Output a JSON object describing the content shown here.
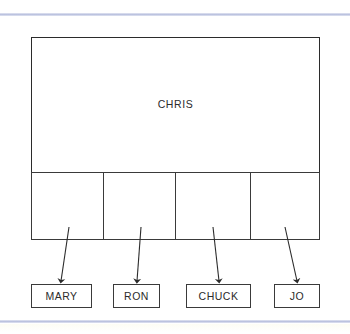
{
  "figure": {
    "kind": "hierarchy-diagram",
    "background_color": "#ffffff",
    "stroke_color": "#2b2b2b",
    "rule_color": "#b9c0de"
  },
  "parent": {
    "label": "CHRIS"
  },
  "cells": [
    {
      "index": 0,
      "label": ""
    },
    {
      "index": 1,
      "label": ""
    },
    {
      "index": 2,
      "label": ""
    },
    {
      "index": 3,
      "label": ""
    }
  ],
  "leaves": [
    {
      "label": "MARY"
    },
    {
      "label": "RON"
    },
    {
      "label": "CHUCK"
    },
    {
      "label": "JO"
    }
  ],
  "connectors": [
    {
      "from_cell": 0,
      "to_leaf": 0,
      "x1": 69,
      "y1": 227,
      "x2": 61,
      "y2": 281
    },
    {
      "from_cell": 1,
      "to_leaf": 1,
      "x1": 141,
      "y1": 227,
      "x2": 137,
      "y2": 281
    },
    {
      "from_cell": 2,
      "to_leaf": 2,
      "x1": 213,
      "y1": 227,
      "x2": 219,
      "y2": 281
    },
    {
      "from_cell": 3,
      "to_leaf": 3,
      "x1": 285,
      "y1": 227,
      "x2": 297,
      "y2": 281
    }
  ]
}
